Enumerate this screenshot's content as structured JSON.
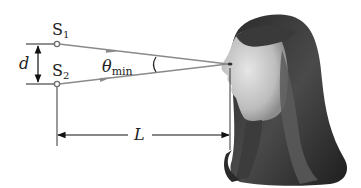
{
  "diagram": {
    "labels": {
      "source1": "S",
      "source1_sub": "1",
      "source2": "S",
      "source2_sub": "2",
      "separation": "d",
      "angle": "θ",
      "angle_sub": "min",
      "distance": "L"
    },
    "elements": {
      "sources": [
        "S1",
        "S2"
      ],
      "rays": [
        "S1 to eye",
        "S2 to eye"
      ],
      "observer": "profile photo of a person (girl with long hair) facing left",
      "dimension_separation": "d between S1 and S2",
      "dimension_distance": "L from sources to observer's eye"
    },
    "colors": {
      "ray": "#8a8a8a",
      "dimension": "#222222",
      "source_circle": "#6f6f6f"
    }
  }
}
